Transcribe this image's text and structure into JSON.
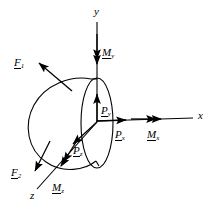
{
  "figure": {
    "type": "free-body-diagram",
    "background_color": "#ffffff",
    "line_color": "#000000",
    "width": 216,
    "height": 212
  },
  "axes": {
    "origin": {
      "x": 97,
      "y": 122
    },
    "x_label": "x",
    "y_label": "y",
    "z_label": "z",
    "x_axis": {
      "from": [
        97,
        122
      ],
      "to": [
        193,
        118
      ],
      "arrow": false
    },
    "y_axis": {
      "from": [
        97,
        122
      ],
      "to": [
        97,
        22
      ],
      "arrow": false
    },
    "z_axis": {
      "from": [
        97,
        122
      ],
      "to": [
        36,
        190
      ],
      "arrow": false
    }
  },
  "forces": [
    {
      "name": "F1",
      "base": "F",
      "sub": "1",
      "label_x": 14,
      "label_y": 53,
      "arrow_from": [
        72,
        91
      ],
      "arrow_to": [
        38,
        62
      ],
      "double_head": false
    },
    {
      "name": "F2",
      "base": "F",
      "sub": "2",
      "label_x": 11,
      "label_y": 163,
      "arrow_from": [
        50,
        141
      ],
      "arrow_to": [
        34,
        172
      ],
      "double_head": false
    },
    {
      "name": "Px",
      "base": "P",
      "sub": "x",
      "label_x": 115,
      "label_y": 127,
      "arrow_from": [
        97,
        121
      ],
      "arrow_to": [
        126,
        120
      ],
      "double_head": false
    },
    {
      "name": "Py",
      "base": "P",
      "sub": "y",
      "label_x": 101,
      "label_y": 103,
      "arrow_from": [
        97,
        122
      ],
      "arrow_to": [
        97,
        94
      ],
      "double_head": false
    },
    {
      "name": "Pz",
      "base": "P",
      "sub": "z",
      "label_x": 73,
      "label_y": 142,
      "arrow_from": [
        97,
        122
      ],
      "arrow_to": [
        72,
        145
      ],
      "double_head": false
    }
  ],
  "moments": [
    {
      "name": "Mx",
      "base": "M",
      "sub": "x",
      "label_x": 147,
      "label_y": 127,
      "arrow_from": [
        130,
        119
      ],
      "arrow_to": [
        160,
        119
      ],
      "double_head": true
    },
    {
      "name": "My",
      "base": "M",
      "sub": "y",
      "label_x": 102,
      "label_y": 45,
      "arrow_from": [
        97,
        34
      ],
      "arrow_to": [
        97,
        64
      ],
      "double_head": true
    },
    {
      "name": "Mz",
      "base": "M",
      "sub": "z",
      "label_x": 52,
      "label_y": 180,
      "arrow_from": [
        78,
        140
      ],
      "arrow_to": [
        60,
        167
      ],
      "double_head": true
    }
  ],
  "body": {
    "name": "rigid-body",
    "shape": "truncated-cone",
    "face_ellipse": {
      "cx": 97,
      "cy": 123,
      "rx": 16,
      "ry": 45
    },
    "outline_path": "M 91,79 C 70,76 46,86 35,105 C 24,124 28,149 45,161 C 62,173 84,170 95,161"
  }
}
